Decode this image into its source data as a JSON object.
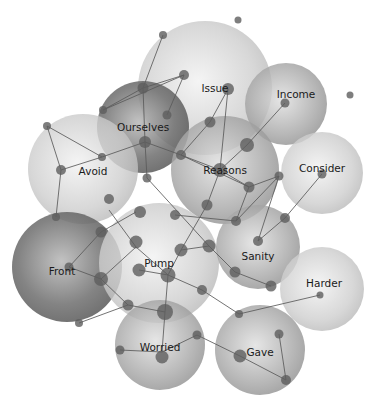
{
  "diagram": {
    "type": "bubble-network",
    "bubbles": [
      {
        "id": "issue",
        "label": "Issue",
        "cx": 205,
        "cy": 88,
        "r": 67,
        "shade": "light"
      },
      {
        "id": "income",
        "label": "Income",
        "cx": 286,
        "cy": 104,
        "r": 41,
        "shade": "medium"
      },
      {
        "id": "ourselves",
        "label": "Ourselves",
        "cx": 143,
        "cy": 127,
        "r": 46,
        "shade": "dark"
      },
      {
        "id": "avoid",
        "label": "Avoid",
        "cx": 83,
        "cy": 169,
        "r": 55,
        "shade": "light"
      },
      {
        "id": "reasons",
        "label": "Reasons",
        "cx": 225,
        "cy": 170,
        "r": 54,
        "shade": "medium"
      },
      {
        "id": "consider",
        "label": "Consider",
        "cx": 322,
        "cy": 173,
        "r": 41,
        "shade": "light"
      },
      {
        "id": "front",
        "label": "Front",
        "cx": 67,
        "cy": 267,
        "r": 55,
        "shade": "dark"
      },
      {
        "id": "pump",
        "label": "Pump",
        "cx": 159,
        "cy": 263,
        "r": 60,
        "shade": "light"
      },
      {
        "id": "sanity",
        "label": "Sanity",
        "cx": 258,
        "cy": 247,
        "r": 42,
        "shade": "medium"
      },
      {
        "id": "harder",
        "label": "Harder",
        "cx": 322,
        "cy": 289,
        "r": 42,
        "shade": "light"
      },
      {
        "id": "worried",
        "label": "Worried",
        "cx": 160,
        "cy": 345,
        "r": 45,
        "shade": "medium"
      },
      {
        "id": "gave",
        "label": "Gave",
        "cx": 260,
        "cy": 350,
        "r": 45,
        "shade": "medium"
      }
    ],
    "stray_nodes": [
      {
        "x": 238,
        "y": 20,
        "r": 3.5
      },
      {
        "x": 350,
        "y": 95,
        "r": 3.5
      }
    ]
  }
}
